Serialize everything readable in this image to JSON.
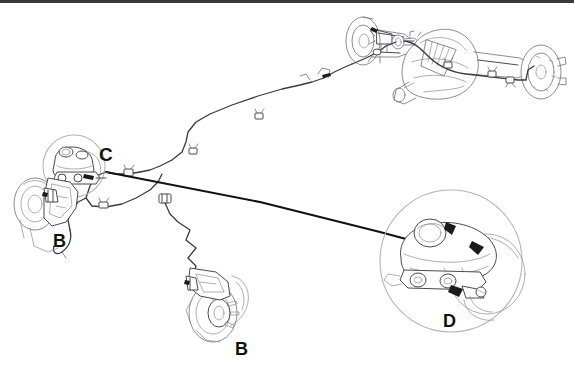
{
  "figure": {
    "kind": "technical-line-drawing",
    "background_color": "#ffffff",
    "line_color": "#4a4a52",
    "heavy_line_color": "#111111",
    "border_color": "#3a3a3a",
    "width": 574,
    "height": 369
  },
  "callouts": [
    {
      "id": "callout-c",
      "label": "C",
      "x": 99,
      "y": 145,
      "size": 19,
      "meaning": "master-cylinder-detail-circle"
    },
    {
      "id": "callout-b-left",
      "label": "B",
      "x": 53,
      "y": 232,
      "size": 18,
      "meaning": "front-left-wheel-brake-detail"
    },
    {
      "id": "callout-b-bottom",
      "label": "B",
      "x": 235,
      "y": 340,
      "size": 18,
      "meaning": "front-right-wheel-brake-detail"
    },
    {
      "id": "callout-d",
      "label": "D",
      "x": 443,
      "y": 312,
      "size": 18,
      "meaning": "master-cylinder-enlarged-detail"
    }
  ],
  "components": [
    {
      "name": "rear-axle-assembly",
      "description": "rear axle housing with differential, brake drums and backing plates"
    },
    {
      "name": "rear-brake-line",
      "description": "brake tube routed along the rear axle housing with retaining clips"
    },
    {
      "name": "front-left-hub",
      "description": "front left wheel hub, rotor and caliper"
    },
    {
      "name": "front-right-hub",
      "description": "front right wheel hub, rotor and caliper"
    },
    {
      "name": "master-cylinder",
      "description": "master cylinder with fluid reservoir mounted on the booster"
    },
    {
      "name": "brake-line-network",
      "description": "hydraulic tubing network linking master cylinder to front and rear brakes"
    },
    {
      "name": "line-clips",
      "description": "small rectangular retaining clips along the brake tubing"
    },
    {
      "name": "detail-circle-c",
      "description": "magnifier circle around the master cylinder area"
    },
    {
      "name": "detail-circle-d",
      "description": "magnifier circle with an enlarged master cylinder view"
    },
    {
      "name": "leader-line-d",
      "description": "heavy straight leader line from the brake line network to detail circle D"
    }
  ]
}
